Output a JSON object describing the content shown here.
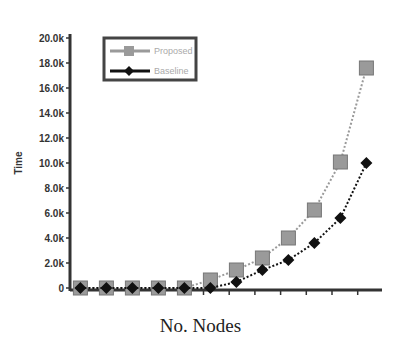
{
  "chart_data": {
    "type": "line",
    "title": "",
    "xlabel": "No. Nodes",
    "ylabel": "Time",
    "x": [
      1,
      2,
      3,
      4,
      5,
      6,
      7,
      8,
      9,
      10,
      11,
      12
    ],
    "xlim": [
      0.6,
      12.6
    ],
    "ylim": [
      0,
      20000
    ],
    "yticks": [
      0,
      2000,
      4000,
      6000,
      8000,
      10000,
      12000,
      14000,
      16000,
      18000,
      20000
    ],
    "ytick_labels": [
      "0",
      "2.0k",
      "4.0k",
      "6.0k",
      "8.0k",
      "10.0k",
      "12.0k",
      "14.0k",
      "16.0k",
      "18.0k",
      "20.0k"
    ],
    "grid": false,
    "legend_position": "upper left",
    "series": [
      {
        "name": "Proposed",
        "marker": "square",
        "color": "#9a9a9a",
        "line": "dotted",
        "values": [
          0,
          0,
          0,
          0,
          0,
          640,
          1440,
          2400,
          4000,
          6240,
          10080,
          17600
        ]
      },
      {
        "name": "Baseline",
        "marker": "diamond",
        "color": "#111111",
        "line": "dotted",
        "values": [
          0,
          0,
          0,
          0,
          0,
          0,
          480,
          1440,
          2240,
          3600,
          5600,
          10000
        ]
      }
    ]
  }
}
